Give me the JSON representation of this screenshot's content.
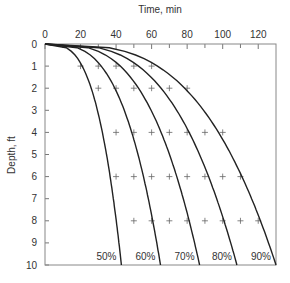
{
  "chart_data": {
    "type": "line",
    "title": "",
    "xlabel": "Time, min",
    "ylabel": "Depth, ft",
    "xlim": [
      0,
      130
    ],
    "ylim": [
      0,
      10
    ],
    "y_inverted": true,
    "x_axis_position": "top",
    "xticks": [
      0,
      20,
      40,
      60,
      80,
      100,
      120
    ],
    "yticks": [
      0,
      1,
      2,
      3,
      4,
      5,
      6,
      7,
      8,
      9,
      10
    ],
    "grid": false,
    "series": [
      {
        "name": "50%",
        "end_time": 43
      },
      {
        "name": "60%",
        "end_time": 65
      },
      {
        "name": "70%",
        "end_time": 87
      },
      {
        "name": "80%",
        "end_time": 108
      },
      {
        "name": "90%",
        "end_time": 130
      }
    ],
    "observation_points": [
      {
        "depth": 1,
        "times": [
          20,
          30,
          40,
          50,
          60
        ]
      },
      {
        "depth": 2,
        "times": [
          30,
          40,
          50,
          60,
          70,
          80
        ]
      },
      {
        "depth": 4,
        "times": [
          40,
          50,
          60,
          70,
          80,
          90,
          100
        ]
      },
      {
        "depth": 6,
        "times": [
          40,
          50,
          60,
          70,
          80,
          90,
          100,
          110
        ]
      },
      {
        "depth": 8,
        "times": [
          50,
          60,
          70,
          80,
          90,
          100,
          110,
          120
        ]
      }
    ]
  }
}
